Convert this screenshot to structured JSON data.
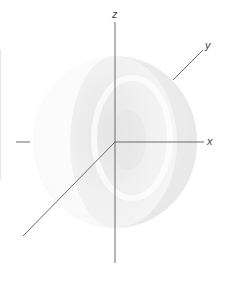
{
  "diagram": {
    "title": "",
    "type": "3d-sphere-with-axes",
    "axes": {
      "x": {
        "label": "x"
      },
      "y": {
        "label": "y"
      },
      "z": {
        "label": "z"
      }
    },
    "colors": {
      "axis": "#6b6b6b",
      "sphere_light": "#ffffff",
      "sphere_mid": "#f0f0f0",
      "sphere_shadow": "#dcdcdc",
      "label": "#444444"
    }
  }
}
